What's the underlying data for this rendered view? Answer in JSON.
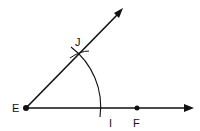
{
  "diagram": {
    "colors": {
      "stroke": "#111111",
      "background": "#ffffff"
    },
    "points": {
      "E": {
        "label": "E",
        "x": 26,
        "y": 108
      },
      "F": {
        "label": "F",
        "x": 137,
        "y": 108
      },
      "J": {
        "label": "J",
        "x": 79,
        "y": 54
      },
      "I": {
        "label": "I",
        "x": 100,
        "y": 108
      }
    },
    "rays": [
      {
        "name": "ray-EF",
        "from": "E",
        "to": [
          194,
          108
        ]
      },
      {
        "name": "ray-EJ",
        "from": "E",
        "to": [
          123,
          8
        ]
      }
    ],
    "arc": {
      "center": "E",
      "radius": 75,
      "from_angle_deg": -50,
      "to_angle_deg": 7
    }
  }
}
